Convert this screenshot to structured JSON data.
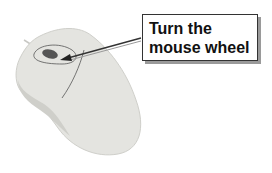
{
  "diagram": {
    "callout": {
      "line1": "Turn the",
      "line2": "mouse wheel"
    },
    "colors": {
      "mouse_body": "#e4e4e0",
      "mouse_shadow": "#c8c8c4",
      "wheel": "#555555",
      "callout_border": "#333333",
      "callout_shadow": "#9a9a9a",
      "text": "#111111"
    }
  }
}
